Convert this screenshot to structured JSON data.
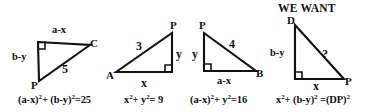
{
  "figure": {
    "title_note": "WE WANT",
    "stroke_color": "#111111",
    "background_color": "#ffffff"
  },
  "triangles": [
    {
      "id": "triangle-1",
      "vertices": [
        {
          "name": "right-angle-corner",
          "label": ""
        },
        {
          "name": "vertex-C",
          "label": "C"
        },
        {
          "name": "vertex-P",
          "label": "P"
        }
      ],
      "sides": [
        {
          "name": "top-side",
          "label": "a-x"
        },
        {
          "name": "left-side",
          "label": "b-y"
        },
        {
          "name": "hypotenuse",
          "label": "5"
        }
      ],
      "equation": {
        "t1": "(a-x)",
        "e1": "2",
        "plus": "+ ",
        "t2": "(b-y)",
        "e2": "2",
        "tail": "=25"
      }
    },
    {
      "id": "triangle-2",
      "vertices": [
        {
          "name": "vertex-A",
          "label": "A"
        },
        {
          "name": "vertex-P",
          "label": "P"
        }
      ],
      "sides": [
        {
          "name": "hypotenuse",
          "label": "3"
        },
        {
          "name": "right-side",
          "label": "y"
        },
        {
          "name": "bottom-side",
          "label": "x"
        }
      ],
      "equation": {
        "t1": "x",
        "e1": "2",
        "plus": "+ ",
        "t2": "y",
        "e2": "2",
        "tail": "= 9"
      }
    },
    {
      "id": "triangle-3",
      "vertices": [
        {
          "name": "vertex-P",
          "label": "P"
        },
        {
          "name": "vertex-B",
          "label": "B"
        }
      ],
      "sides": [
        {
          "name": "hypotenuse",
          "label": "4"
        },
        {
          "name": "left-side",
          "label": "y"
        },
        {
          "name": "bottom-side",
          "label": "a-x"
        }
      ],
      "equation": {
        "t1": "(a-x)",
        "e1": "2",
        "plus": "+ ",
        "t2": "y",
        "e2": "2",
        "tail": "=16"
      }
    },
    {
      "id": "triangle-4",
      "vertices": [
        {
          "name": "vertex-D",
          "label": "D"
        },
        {
          "name": "vertex-P",
          "label": "P"
        }
      ],
      "sides": [
        {
          "name": "hypotenuse",
          "label": "?"
        },
        {
          "name": "left-side",
          "label": "b-y"
        },
        {
          "name": "bottom-side",
          "label": "x"
        }
      ],
      "equation": {
        "t1": "x",
        "e1": "2",
        "plus": "+ ",
        "t2": "(b-y)",
        "e2": "2",
        "tail": " =(DP)",
        "e3": "2"
      }
    }
  ]
}
